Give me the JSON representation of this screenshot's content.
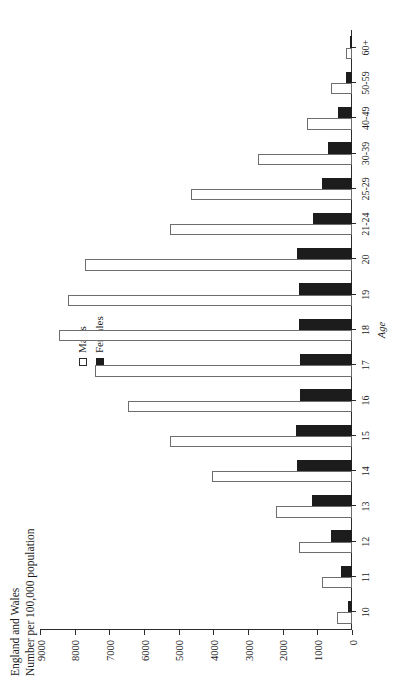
{
  "header": {
    "line1": "England and Wales",
    "line2": "Number per 100,000 population"
  },
  "legend": {
    "position": "top-right",
    "items": [
      {
        "label": "Males",
        "swatch": "hollow-square",
        "color": "#ffffff"
      },
      {
        "label": "Females",
        "swatch": "filled-square",
        "color": "#1c1c1c"
      }
    ]
  },
  "axes": {
    "value_axis_title": "Number per 100,000 population",
    "category_axis_title": "Age",
    "value_ticks": [
      "0",
      "1000",
      "2000",
      "3000",
      "4000",
      "5000",
      "6000",
      "7000",
      "8000",
      "9000"
    ]
  },
  "chart_data": {
    "type": "bar",
    "subtitle": "",
    "orientation": "vertical-bars-rotated-page",
    "xlabel": "Age",
    "ylabel": "Number per 100,000 population",
    "ylim": [
      0,
      9000
    ],
    "ytick_step": 1000,
    "grid": false,
    "legend_position": "top-right",
    "categories": [
      "10",
      "11",
      "12",
      "13",
      "14",
      "15",
      "16",
      "17",
      "18",
      "19",
      "20",
      "21-24",
      "25-29",
      "30-39",
      "40-49",
      "50-59",
      "60+"
    ],
    "series": [
      {
        "name": "Males",
        "color": "#ffffff",
        "values": [
          430,
          870,
          1520,
          2200,
          4030,
          5250,
          6450,
          7400,
          8450,
          8180,
          7700,
          5250,
          4650,
          2700,
          1300,
          600,
          180
        ]
      },
      {
        "name": "Females",
        "color": "#1c1c1c",
        "values": [
          120,
          320,
          600,
          1150,
          1580,
          1620,
          1500,
          1500,
          1520,
          1530,
          1600,
          1120,
          880,
          700,
          390,
          180,
          60
        ]
      }
    ]
  }
}
